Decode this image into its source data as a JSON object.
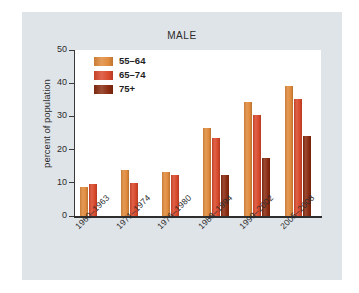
{
  "chart_data": {
    "type": "bar",
    "title": "MALE",
    "xlabel": "",
    "ylabel": "percent of population",
    "ylim": [
      0,
      50
    ],
    "yticks": [
      0,
      10,
      20,
      30,
      40,
      50
    ],
    "grid": false,
    "legend_position": "upper-left-inside",
    "categories": [
      "1960–1963",
      "1971–1974",
      "1976–1980",
      "1988–1994",
      "1999–2002",
      "2005–2008"
    ],
    "series": [
      {
        "name": "55–64",
        "color": "#e08a3c",
        "values": [
          8.7,
          13.8,
          13.4,
          26.5,
          34.3,
          39.1
        ]
      },
      {
        "name": "65–74",
        "color": "#d9492b",
        "values": [
          9.6,
          9.8,
          12.5,
          23.4,
          30.3,
          35.1
        ]
      },
      {
        "name": "75+",
        "color": "#8a2b11",
        "values": [
          null,
          null,
          null,
          12.4,
          17.4,
          24.1
        ]
      }
    ]
  },
  "colors": {
    "background": "#ffffff",
    "card": "#dfe4e9",
    "plot_area": "#ffffff",
    "axis": "#2e2e2e",
    "text": "#2b2b2b",
    "series_55_64": "#e08a3c",
    "series_65_74": "#d9492b",
    "series_75_plus": "#8a2b11"
  }
}
